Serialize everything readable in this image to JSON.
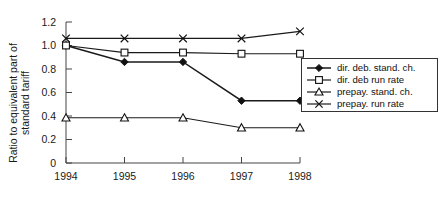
{
  "chart_data": {
    "type": "line",
    "title": "",
    "xlabel": "",
    "ylabel": "Ratio to equivalent part of standard tariff",
    "ylabel_line1": "Ratio to equivalent part of",
    "ylabel_line2": "standard tariff",
    "x": [
      1994,
      1995,
      1996,
      1997,
      1998
    ],
    "categories": [
      "1994",
      "1995",
      "1996",
      "1997",
      "1998"
    ],
    "xlim": [
      1994,
      1998
    ],
    "ylim": [
      0,
      1.2
    ],
    "yticks": [
      0,
      0.2,
      0.4,
      0.6,
      0.8,
      1.0,
      1.2
    ],
    "ytick_labels": [
      "0",
      "0.2",
      "0.4",
      "0.6",
      "0.8",
      "1.0",
      "1.2"
    ],
    "xtick_labels": [
      "1994",
      "1995",
      "1996",
      "1997",
      "1998"
    ],
    "grid": false,
    "legend_position": "right-middle",
    "series": [
      {
        "name": "dir. deb. stand. ch.",
        "marker": "filled-diamond",
        "values": [
          1.0,
          0.86,
          0.86,
          0.53,
          0.53
        ]
      },
      {
        "name": "dir. deb run rate",
        "marker": "open-square",
        "values": [
          1.0,
          0.94,
          0.94,
          0.93,
          0.93
        ]
      },
      {
        "name": "prepay. stand. ch.",
        "marker": "open-triangle",
        "values": [
          0.385,
          0.385,
          0.385,
          0.3,
          0.3
        ]
      },
      {
        "name": "prepay. run rate",
        "marker": "cross",
        "values": [
          1.06,
          1.06,
          1.06,
          1.06,
          1.12
        ]
      }
    ]
  },
  "colors": {
    "ink": "#111111",
    "axis": "#444444",
    "background": "#ffffff"
  }
}
